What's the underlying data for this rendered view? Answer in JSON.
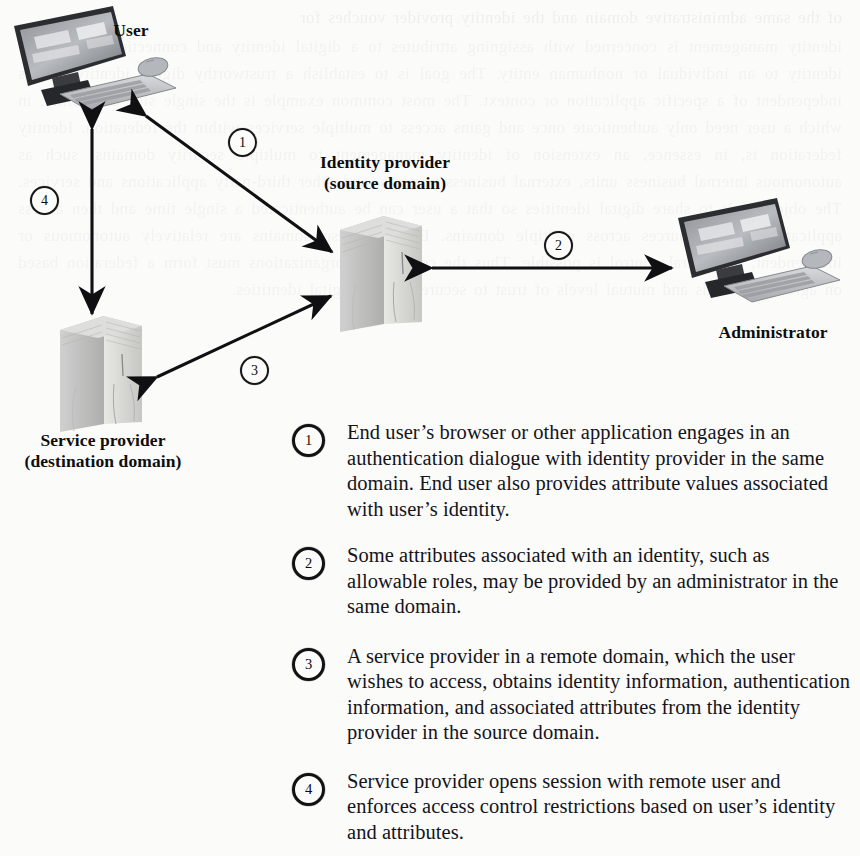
{
  "figure": {
    "type": "diagram",
    "background_color": "#fbfbfa",
    "ink_color": "#111111"
  },
  "nodes": [
    {
      "id": "user",
      "label": "User",
      "sublabel": "",
      "icon": "desktop-workstation"
    },
    {
      "id": "identity-provider",
      "label": "Identity provider",
      "sublabel": "(source domain)",
      "icon": "server-tower"
    },
    {
      "id": "service-provider",
      "label": "Service provider",
      "sublabel": "(destination domain)",
      "icon": "server-tower"
    },
    {
      "id": "administrator",
      "label": "Administrator",
      "sublabel": "",
      "icon": "desktop-workstation"
    }
  ],
  "arrow_markers": [
    {
      "number": "1",
      "from": "user",
      "to": "identity-provider"
    },
    {
      "number": "2",
      "from": "identity-provider",
      "to": "administrator"
    },
    {
      "number": "3",
      "from": "service-provider",
      "to": "identity-provider"
    },
    {
      "number": "4",
      "from": "user",
      "to": "service-provider"
    }
  ],
  "legend": [
    {
      "number": "1",
      "text": "End user’s browser or other application engages in an authentication dialogue with identity provider in the same domain. End user also provides attribute values associated with user’s identity."
    },
    {
      "number": "2",
      "text": "Some attributes associated with an identity, such as allowable roles, may be provided by an administrator in the same domain."
    },
    {
      "number": "3",
      "text": "A service provider in a remote domain, which the user wishes to access, obtains identity information, authentication information, and associated attributes from the identity provider in the source domain."
    },
    {
      "number": "4",
      "text": "Service provider opens session with remote user and enforces access control restrictions based on user’s identity and attributes."
    }
  ],
  "ghost_text": {
    "line_top": "of the same administrative domain and the identity provider vouches for",
    "block": "identity management is concerned with assigning attributes to a digital identity and connecting that digital identity to an individual or nonhuman entity. The goal is to establish a trustworthy digital identity that is independent of a specific application or context. The most common example is the single sign-on facility, in which a user need only authenticate once and gains access to multiple services within the federation. Identity federation is, in essence, an extension of identity management to multiple security domains, such as autonomous internal business units, external business partners, and other third-party applications and services. The objective is to share digital identities so that a user can be authenticated a single time and then access applications and resources across multiple domains. Because these domains are relatively autonomous or independent, no central control is possible. Thus the cooperating organizations must form a federation based on agreed standards and mutual levels of trust to securely share digital identities."
  }
}
